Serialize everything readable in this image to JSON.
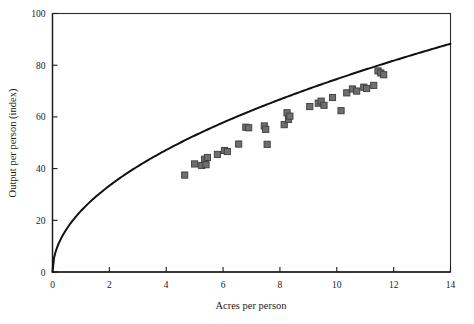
{
  "figure": {
    "background_color": "#ffffff",
    "frame_color": "#2a2a2a",
    "marker_fill": "#6e6e6e",
    "marker_edge": "#3c3c3c",
    "curve_color": "#111111"
  },
  "chart_data": {
    "type": "scatter",
    "title": "",
    "subtitle": "",
    "xlabel": "Acres per person",
    "ylabel": "Output per person (index)",
    "xlim": [
      0,
      14
    ],
    "ylim": [
      0,
      100
    ],
    "xticks": [
      0,
      2,
      4,
      6,
      8,
      10,
      12,
      14
    ],
    "xtick_labels": [
      "0",
      "2",
      "4",
      "6",
      "8",
      "10",
      "12",
      "14"
    ],
    "yticks": [
      0,
      20,
      40,
      60,
      80,
      100
    ],
    "ytick_labels": [
      "0",
      "20",
      "40",
      "60",
      "80",
      "100"
    ],
    "grid": false,
    "legend": null,
    "legend_position": "none",
    "annotations": [],
    "series": [
      {
        "name": "Observations",
        "type": "scatter",
        "marker": "square",
        "color": "#6e6e6e",
        "points": [
          {
            "x": 4.65,
            "y": 37.5
          },
          {
            "x": 5.0,
            "y": 41.8
          },
          {
            "x": 5.25,
            "y": 41.2
          },
          {
            "x": 5.35,
            "y": 43.6
          },
          {
            "x": 5.4,
            "y": 41.5
          },
          {
            "x": 5.45,
            "y": 44.3
          },
          {
            "x": 5.8,
            "y": 45.5
          },
          {
            "x": 6.05,
            "y": 47.0
          },
          {
            "x": 6.15,
            "y": 46.6
          },
          {
            "x": 6.55,
            "y": 49.5
          },
          {
            "x": 6.8,
            "y": 56.0
          },
          {
            "x": 6.9,
            "y": 55.8
          },
          {
            "x": 7.45,
            "y": 56.5
          },
          {
            "x": 7.5,
            "y": 55.2
          },
          {
            "x": 7.55,
            "y": 49.4
          },
          {
            "x": 8.15,
            "y": 57.0
          },
          {
            "x": 8.25,
            "y": 61.6
          },
          {
            "x": 8.3,
            "y": 59.0
          },
          {
            "x": 8.35,
            "y": 60.3
          },
          {
            "x": 9.05,
            "y": 64.0
          },
          {
            "x": 9.35,
            "y": 65.3
          },
          {
            "x": 9.45,
            "y": 66.1
          },
          {
            "x": 9.55,
            "y": 64.5
          },
          {
            "x": 9.85,
            "y": 67.5
          },
          {
            "x": 10.15,
            "y": 62.4
          },
          {
            "x": 10.35,
            "y": 69.3
          },
          {
            "x": 10.55,
            "y": 70.8
          },
          {
            "x": 10.7,
            "y": 70.0
          },
          {
            "x": 10.95,
            "y": 71.5
          },
          {
            "x": 11.05,
            "y": 71.0
          },
          {
            "x": 11.3,
            "y": 72.2
          },
          {
            "x": 11.45,
            "y": 77.8
          },
          {
            "x": 11.55,
            "y": 77.0
          },
          {
            "x": 11.65,
            "y": 76.3
          }
        ]
      },
      {
        "name": "Fitted curve",
        "type": "line",
        "color": "#111111",
        "description": "Concave fitted production curve through origin",
        "model": "y = 23.6 * x^0.5",
        "coefficient": 23.6,
        "exponent": 0.5,
        "x_start": 0,
        "x_end": 14,
        "y_at_x_end": 88.3
      }
    ]
  }
}
